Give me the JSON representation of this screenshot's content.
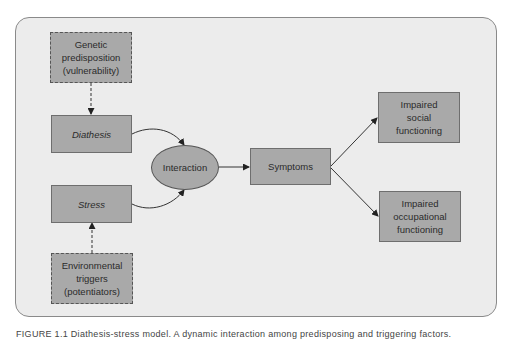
{
  "diagram": {
    "nodes": {
      "genetic": "Genetic\npredisposition\n(vulnerability)",
      "diathesis": "Diathesis",
      "interaction": "Interaction",
      "stress": "Stress",
      "environmental": "Environmental\ntriggers\n(potentiators)",
      "symptoms": "Symptoms",
      "social": "Impaired\nsocial\nfunctioning",
      "occupational": "Impaired\noccupational\nfunctioning"
    },
    "edges": [
      {
        "from": "genetic",
        "to": "diathesis",
        "style": "dashed"
      },
      {
        "from": "environmental",
        "to": "stress",
        "style": "dashed"
      },
      {
        "from": "diathesis",
        "to": "interaction",
        "style": "solid-curved"
      },
      {
        "from": "stress",
        "to": "interaction",
        "style": "solid-curved"
      },
      {
        "from": "interaction",
        "to": "symptoms",
        "style": "solid"
      },
      {
        "from": "symptoms",
        "to": "social",
        "style": "solid"
      },
      {
        "from": "symptoms",
        "to": "occupational",
        "style": "solid"
      }
    ],
    "colors": {
      "panel": "#ececec",
      "node_fill": "#a9a9a9",
      "border": "#6e6e6e"
    }
  },
  "caption": "FIGURE 1.1 Diathesis-stress model. A dynamic interaction among predisposing and triggering factors."
}
